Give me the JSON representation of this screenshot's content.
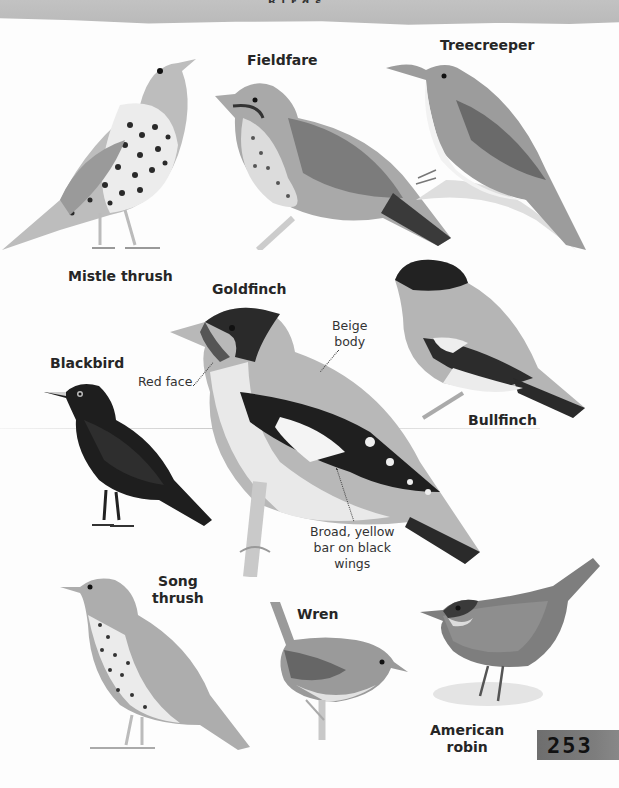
{
  "page": {
    "page_number": "253",
    "header_fragment": "Birds"
  },
  "colors": {
    "background": "#fdfdfd",
    "header_band": "#bdbdbd",
    "page_tab": "#777777",
    "label_text": "#262626"
  },
  "birds": [
    {
      "id": "mistle-thrush",
      "label": "Mistle thrush"
    },
    {
      "id": "fieldfare",
      "label": "Fieldfare"
    },
    {
      "id": "treecreeper",
      "label": "Treecreeper"
    },
    {
      "id": "goldfinch",
      "label": "Goldfinch"
    },
    {
      "id": "blackbird",
      "label": "Blackbird"
    },
    {
      "id": "bullfinch",
      "label": "Bullfinch"
    },
    {
      "id": "song-thrush",
      "label_line1": "Song",
      "label_line2": "thrush"
    },
    {
      "id": "wren",
      "label": "Wren"
    },
    {
      "id": "american-robin",
      "label_line1": "American",
      "label_line2": "robin"
    }
  ],
  "annotations": {
    "goldfinch": {
      "red_face": "Red face",
      "beige_body_line1": "Beige",
      "beige_body_line2": "body",
      "wing_bar_line1": "Broad, yellow",
      "wing_bar_line2": "bar on black",
      "wing_bar_line3": "wings"
    }
  }
}
